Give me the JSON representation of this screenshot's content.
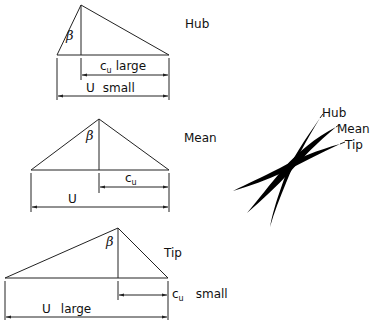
{
  "diagram": {
    "triangles": [
      {
        "name": "Hub",
        "label": "Hub",
        "angle_label": "β",
        "cu_label": "c",
        "cu_sub": "u",
        "cu_qualifier": "large",
        "u_label": "U",
        "u_qualifier": "small"
      },
      {
        "name": "Mean",
        "label": "Mean",
        "angle_label": "β",
        "cu_label": "c",
        "cu_sub": "u",
        "cu_qualifier": "",
        "u_label": "U",
        "u_qualifier": ""
      },
      {
        "name": "Tip",
        "label": "Tip",
        "angle_label": "β",
        "cu_label": "c",
        "cu_sub": "u",
        "cu_qualifier": "small",
        "u_label": "U",
        "u_qualifier": "large"
      }
    ],
    "blade_profiles": {
      "labels": [
        "Hub",
        "Mean",
        "Tip"
      ]
    }
  }
}
